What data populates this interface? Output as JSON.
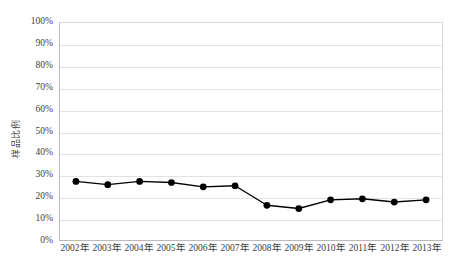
{
  "chart_data": {
    "type": "line",
    "title": "",
    "subtitle": "",
    "xlabel": "",
    "ylabel": "样品比例",
    "categories": [
      "2002年",
      "2003年",
      "2004年",
      "2005年",
      "2006年",
      "2007年",
      "2008年",
      "2009年",
      "2010年",
      "2011年",
      "2012年",
      "2013年"
    ],
    "values": [
      27,
      25.5,
      27,
      26.5,
      24.5,
      25,
      16,
      14.5,
      18.5,
      19,
      17.5,
      18.5
    ],
    "series": [
      {
        "name": "样品比例",
        "values": [
          27,
          25.5,
          27,
          26.5,
          24.5,
          25,
          16,
          14.5,
          18.5,
          19,
          17.5,
          18.5
        ]
      }
    ],
    "ylim": [
      0,
      100
    ],
    "y_ticks": [
      0,
      10,
      20,
      30,
      40,
      50,
      60,
      70,
      80,
      90,
      100
    ],
    "y_tick_labels": [
      "0%",
      "10%",
      "20%",
      "30%",
      "40%",
      "50%",
      "60%",
      "70%",
      "80%",
      "90%",
      "100%"
    ],
    "grid": true,
    "legend": "none",
    "marker": "circle",
    "marker_color": "#000000",
    "line_color": "#000000",
    "grid_color": "#e2e2e2",
    "axis_color": "#b9b9b9",
    "background_color": "#ffffff",
    "text_color": "#3d3d3d"
  }
}
